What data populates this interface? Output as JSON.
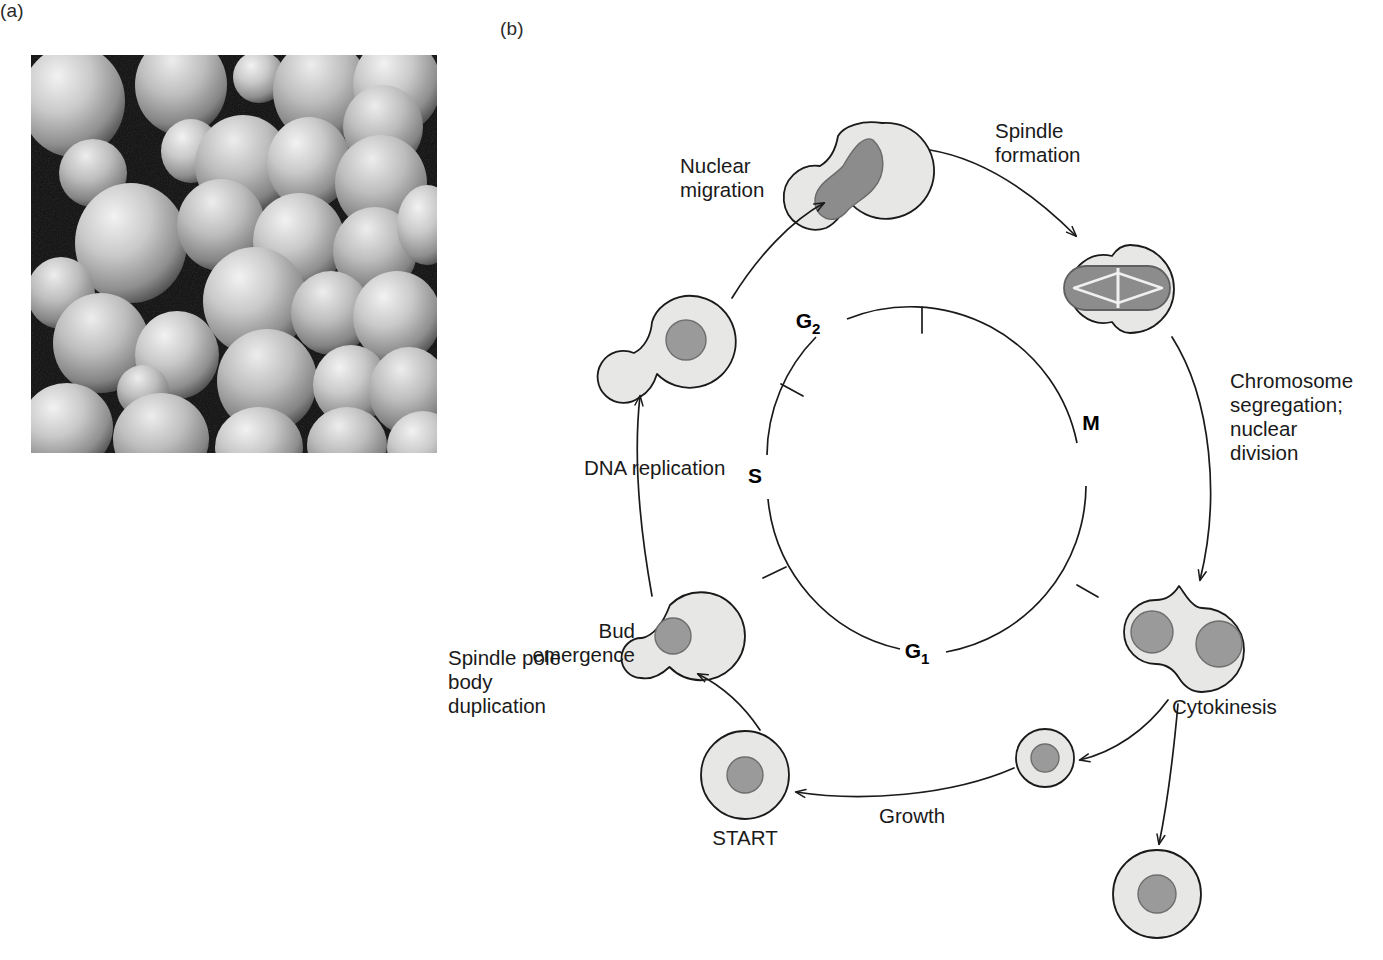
{
  "figure": {
    "panel_a_label": "(a)",
    "panel_b_label": "(b)",
    "panel_a_description": "scanning-electron-micrograph-of-budding-yeast-cells"
  },
  "colors": {
    "cytoplasm": "#e7e7e5",
    "nucleus": "#9a9a9a",
    "spindle_nucleus": "#8c8c8c",
    "outline": "#1a1a1a",
    "text": "#1a1a1a",
    "background": "#ffffff"
  },
  "cycle_diagram": {
    "phases": [
      {
        "id": "G2",
        "label": "G",
        "sub": "2",
        "position": "upper-left"
      },
      {
        "id": "S",
        "label": "S",
        "sub": "",
        "position": "left"
      },
      {
        "id": "G1",
        "label": "G",
        "sub": "1",
        "position": "bottom"
      },
      {
        "id": "M",
        "label": "M",
        "sub": "",
        "position": "right"
      }
    ],
    "transitions": [
      {
        "id": "nuclear-migration",
        "label": "Nuclear\nmigration",
        "lines": [
          "Nuclear",
          "migration"
        ]
      },
      {
        "id": "spindle-formation",
        "label": "Spindle\nformation",
        "lines": [
          "Spindle",
          "formation"
        ]
      },
      {
        "id": "chromosome-segregation",
        "label": "Chromosome segregation; nuclear division",
        "lines": [
          "Chromosome",
          "segregation;",
          "nuclear",
          "division"
        ]
      },
      {
        "id": "cytokinesis",
        "label": "Cytokinesis",
        "lines": [
          "Cytokinesis"
        ]
      },
      {
        "id": "growth",
        "label": "Growth",
        "lines": [
          "Growth"
        ]
      },
      {
        "id": "start",
        "label": "START",
        "lines": [
          "START"
        ]
      },
      {
        "id": "bud-emergence",
        "label": "Bud emergence",
        "lines": [
          "Bud",
          "emergence"
        ]
      },
      {
        "id": "spindle-pole-body",
        "label": "Spindle pole body duplication",
        "lines": [
          "Spindle pole",
          "body",
          "duplication"
        ]
      },
      {
        "id": "dna-replication",
        "label": "DNA replication",
        "lines": [
          "DNA replication"
        ]
      }
    ],
    "cell_stages": [
      {
        "id": "start-cell",
        "description": "unbudded-cell-with-single-nucleus"
      },
      {
        "id": "bud-emergence-cell",
        "description": "cell-with-small-bud-and-single-nucleus"
      },
      {
        "id": "dna-replication-cell",
        "description": "cell-with-medium-bud-and-single-nucleus"
      },
      {
        "id": "nuclear-migration-cell",
        "description": "cell-with-elongated-nucleus-spanning-neck"
      },
      {
        "id": "spindle-cell",
        "description": "cell-with-mitotic-spindle-in-nucleus"
      },
      {
        "id": "divided-nuclei-cell",
        "description": "cell-with-two-separated-nuclei"
      },
      {
        "id": "daughter-cell",
        "description": "small-daughter-cell-with-nucleus"
      },
      {
        "id": "mother-cell",
        "description": "large-mother-cell-with-nucleus"
      }
    ]
  }
}
